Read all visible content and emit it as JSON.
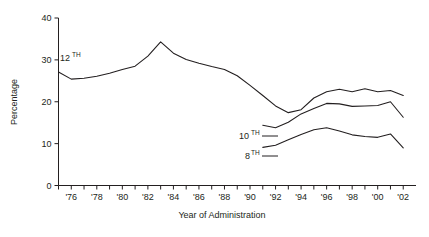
{
  "chart_data": {
    "type": "line",
    "title": "",
    "xlabel": "Year of Administration",
    "ylabel": "Percentage",
    "ylim": [
      0,
      40
    ],
    "yticks": [
      0,
      10,
      20,
      30,
      40
    ],
    "ytick_labels": [
      "0",
      "10",
      "20",
      "30",
      "40"
    ],
    "grid": false,
    "legend_position": "inline-annotations",
    "xlim": [
      1975,
      2003
    ],
    "x": [
      1975,
      1976,
      1977,
      1978,
      1979,
      1980,
      1981,
      1982,
      1983,
      1984,
      1985,
      1986,
      1987,
      1988,
      1989,
      1990,
      1991,
      1992,
      1993,
      1994,
      1995,
      1996,
      1997,
      1998,
      1999,
      2000,
      2001,
      2002
    ],
    "xtick_labels": [
      "",
      "'76",
      "",
      "'78",
      "",
      "'80",
      "",
      "'82",
      "",
      "'84",
      "",
      "'86",
      "",
      "'88",
      "",
      "'90",
      "",
      "'92",
      "",
      "'94",
      "",
      "'96",
      "",
      "'98",
      "",
      "'00",
      "",
      "'02"
    ],
    "series": [
      {
        "name": "12TH",
        "label": "12",
        "label_sup": "TH",
        "color": "#231f20",
        "x": [
          1975,
          1976,
          1977,
          1978,
          1979,
          1980,
          1981,
          1982,
          1983,
          1984,
          1985,
          1986,
          1987,
          1988,
          1989,
          1990,
          1991,
          1992,
          1993,
          1994,
          1995,
          1996,
          1997,
          1998,
          1999,
          2000,
          2001,
          2002
        ],
        "values": [
          27.1,
          25.4,
          25.6,
          26.1,
          26.8,
          27.7,
          28.5,
          30.9,
          34.3,
          31.6,
          30.1,
          29.2,
          28.4,
          27.7,
          26.2,
          23.9,
          21.5,
          19.0,
          17.4,
          18.1,
          20.9,
          22.4,
          23.0,
          22.4,
          23.1,
          22.4,
          22.7,
          21.5
        ]
      },
      {
        "name": "10TH",
        "label": "10",
        "label_sup": "TH",
        "color": "#231f20",
        "x": [
          1991,
          1992,
          1993,
          1994,
          1995,
          1996,
          1997,
          1998,
          1999,
          2000,
          2001,
          2002
        ],
        "values": [
          14.4,
          13.8,
          15.1,
          17.1,
          18.4,
          19.6,
          19.5,
          18.9,
          19.0,
          19.1,
          20.0,
          16.3
        ]
      },
      {
        "name": "8TH",
        "label": "8",
        "label_sup": "TH",
        "color": "#231f20",
        "x": [
          1991,
          1992,
          1993,
          1994,
          1995,
          1996,
          1997,
          1998,
          1999,
          2000,
          2001,
          2002
        ],
        "values": [
          9.1,
          9.6,
          10.9,
          12.2,
          13.3,
          13.8,
          13.0,
          12.1,
          11.7,
          11.5,
          12.3,
          9.0
        ]
      }
    ],
    "annotations": [
      {
        "text": "12",
        "sup": "TH",
        "series": "12TH"
      },
      {
        "text": "10",
        "sup": "TH",
        "series": "10TH"
      },
      {
        "text": "8",
        "sup": "TH",
        "series": "8TH"
      }
    ]
  }
}
